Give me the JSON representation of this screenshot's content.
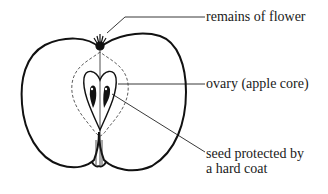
{
  "diagram": {
    "labels": [
      {
        "id": "remains-of-flower",
        "text": "remains of flower"
      },
      {
        "id": "ovary",
        "text": "ovary (apple core)"
      },
      {
        "id": "seed",
        "line1": "seed protected by",
        "line2": "a hard coat"
      }
    ],
    "colors": {
      "stroke": "#111111",
      "background": "#ffffff"
    }
  }
}
